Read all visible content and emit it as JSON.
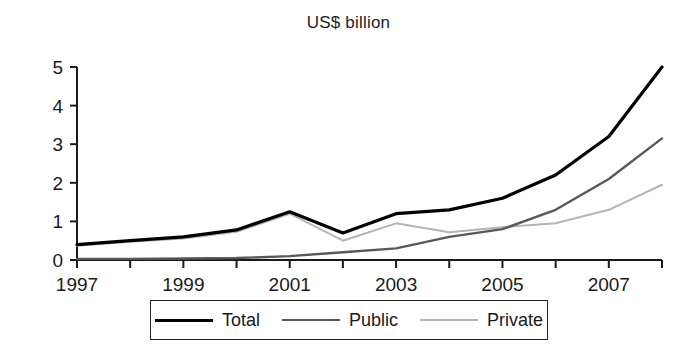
{
  "chart_data": {
    "type": "line",
    "title": "US$ billion",
    "xlabel": "",
    "ylabel": "",
    "x": [
      1997,
      1998,
      1999,
      2000,
      2001,
      2002,
      2003,
      2004,
      2005,
      2006,
      2007,
      2008
    ],
    "categories": [
      "1997",
      "1998",
      "1999",
      "2000",
      "2001",
      "2002",
      "2003",
      "2004",
      "2005",
      "2006",
      "2007",
      "2008"
    ],
    "xtick_labels": [
      "1997",
      "1999",
      "2001",
      "2003",
      "2005",
      "2007"
    ],
    "xtick_values": [
      1997,
      1999,
      2001,
      2003,
      2005,
      2007
    ],
    "ytick_labels": [
      "0",
      "1",
      "2",
      "3",
      "4",
      "5"
    ],
    "ytick_values": [
      0,
      1,
      2,
      3,
      4,
      5
    ],
    "xlim": [
      1997,
      2008
    ],
    "ylim": [
      0,
      5
    ],
    "grid": false,
    "legend_position": "bottom",
    "series": [
      {
        "name": "Total",
        "color": "#000000",
        "width": 3.2,
        "values": [
          0.4,
          0.5,
          0.6,
          0.78,
          1.25,
          0.7,
          1.2,
          1.3,
          1.6,
          2.2,
          3.2,
          5.0
        ]
      },
      {
        "name": "Public",
        "color": "#585858",
        "width": 2.4,
        "values": [
          0.03,
          0.03,
          0.04,
          0.05,
          0.1,
          0.2,
          0.3,
          0.6,
          0.8,
          1.3,
          2.1,
          3.15
        ]
      },
      {
        "name": "Private",
        "color": "#b4b4b4",
        "width": 2.0,
        "values": [
          0.37,
          0.47,
          0.56,
          0.73,
          1.2,
          0.5,
          0.95,
          0.72,
          0.85,
          0.95,
          1.3,
          1.95
        ]
      }
    ]
  },
  "legend": {
    "items": [
      {
        "label": "Total"
      },
      {
        "label": "Public"
      },
      {
        "label": "Private"
      }
    ]
  }
}
